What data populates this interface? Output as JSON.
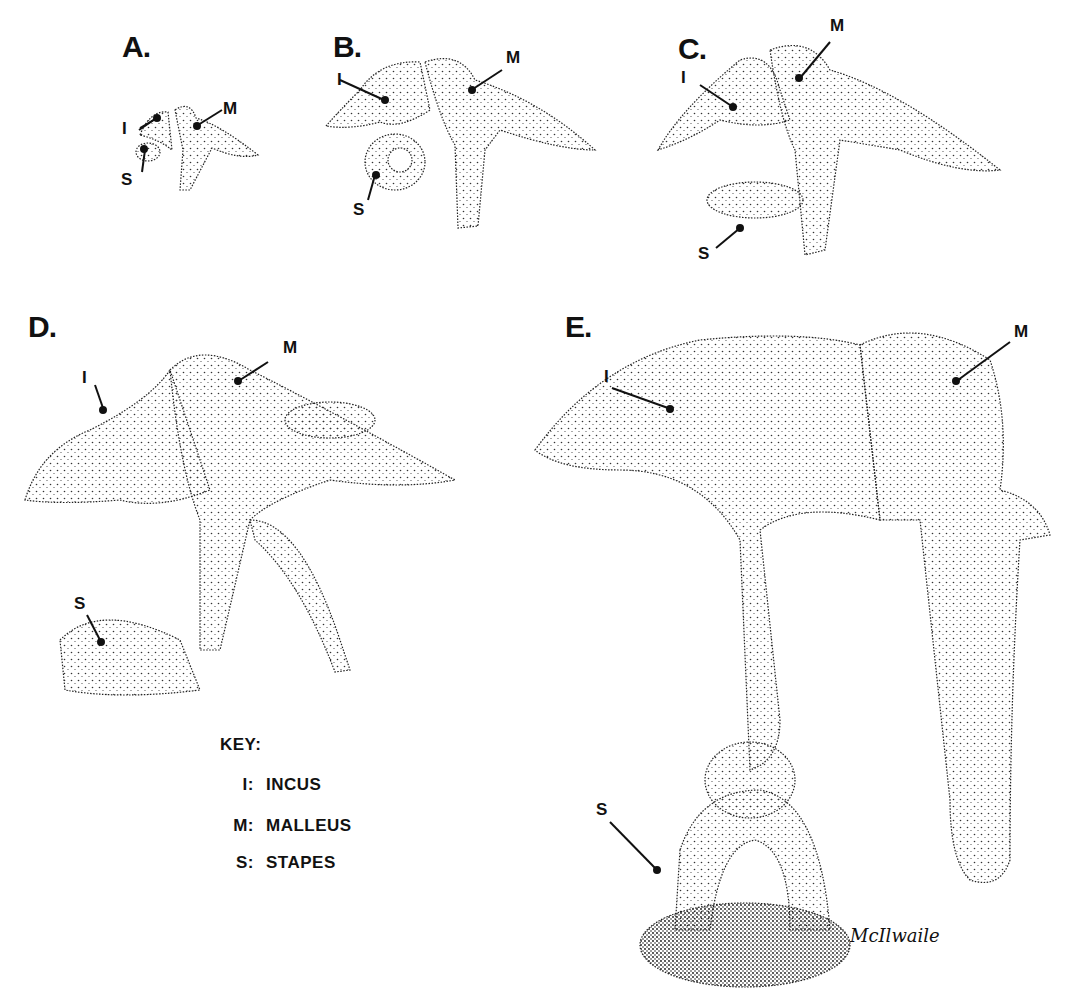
{
  "figure": {
    "panels": [
      {
        "id": "A",
        "label": "A.",
        "callouts": [
          "I",
          "M",
          "S"
        ]
      },
      {
        "id": "B",
        "label": "B.",
        "callouts": [
          "I",
          "M",
          "S"
        ]
      },
      {
        "id": "C",
        "label": "C.",
        "callouts": [
          "I",
          "M",
          "S"
        ]
      },
      {
        "id": "D",
        "label": "D.",
        "callouts": [
          "I",
          "M",
          "S"
        ]
      },
      {
        "id": "E",
        "label": "E.",
        "callouts": [
          "I",
          "M",
          "S"
        ]
      }
    ],
    "key": {
      "title": "KEY:",
      "items": [
        {
          "abbr": "I:",
          "name": "INCUS"
        },
        {
          "abbr": "M:",
          "name": "MALLEUS"
        },
        {
          "abbr": "S:",
          "name": "STAPES"
        }
      ]
    },
    "signature": "McIlwaile",
    "colors": {
      "ink": "#111111",
      "paper": "#ffffff",
      "stipple": "#333333"
    }
  }
}
